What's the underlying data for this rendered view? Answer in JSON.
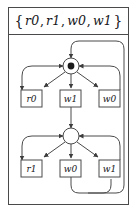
{
  "header": {
    "open_brace": "{",
    "close_brace": "}",
    "comma": ",",
    "events": [
      "r0",
      "r1",
      "w0",
      "w1"
    ]
  },
  "diagram": {
    "type": "state-transition-graph",
    "nodes": [
      {
        "id": "n-top",
        "shape": "circle-filled-dot",
        "marked": true,
        "cx": 63,
        "cy": 31,
        "r": 8
      },
      {
        "id": "n-bottom",
        "shape": "circle-empty",
        "marked": false,
        "cx": 63,
        "cy": 101,
        "r": 8
      }
    ],
    "transition_boxes": [
      {
        "id": "box-top-left",
        "label": "r0",
        "row": "top",
        "x": 13,
        "y": 55,
        "w": 21,
        "h": 17
      },
      {
        "id": "box-top-middle",
        "label": "w1",
        "row": "top",
        "x": 52,
        "y": 55,
        "w": 21,
        "h": 17
      },
      {
        "id": "box-top-right",
        "label": "w0",
        "row": "top",
        "x": 91,
        "y": 55,
        "w": 21,
        "h": 17
      },
      {
        "id": "box-bottom-left",
        "label": "r1",
        "row": "bottom",
        "x": 13,
        "y": 125,
        "w": 21,
        "h": 17
      },
      {
        "id": "box-bottom-middle",
        "label": "w0",
        "row": "bottom",
        "x": 52,
        "y": 125,
        "w": 21,
        "h": 17
      },
      {
        "id": "box-bottom-right",
        "label": "w1",
        "row": "bottom",
        "x": 91,
        "y": 125,
        "w": 21,
        "h": 17
      }
    ],
    "colors": {
      "stroke": "#4a4a4a",
      "text": "#16161a",
      "background": "#ffffff",
      "node_fill": "#ffffff",
      "node_dot": "#1a1a1a"
    }
  }
}
